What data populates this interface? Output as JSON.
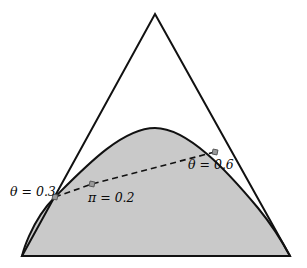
{
  "figure": {
    "title": "",
    "background_color": "#ffffff",
    "width": 307,
    "height": 268
  },
  "chart_data": {
    "type": "scatter",
    "title": "",
    "xlabel": "",
    "ylabel": "",
    "grid": false,
    "legend_position": "none",
    "shapes": [
      {
        "name": "simplex-triangle",
        "type": "polygon",
        "fill": "none",
        "stroke": "#111111",
        "stroke_width": 2,
        "points": [
          [
            155,
            14
          ],
          [
            290,
            256
          ],
          [
            22,
            256
          ]
        ]
      },
      {
        "name": "shaded-dome-region",
        "type": "closed-curve",
        "fill": "#c9c9c9",
        "stroke": "#111111",
        "stroke_width": 2,
        "peak": [
          155,
          128
        ],
        "left_tangent_point": [
          55,
          197
        ],
        "right_tangent_point": [
          278,
          239
        ],
        "base_left": [
          22,
          256
        ],
        "base_right": [
          290,
          256
        ]
      }
    ],
    "path": {
      "name": "dashed-trajectory",
      "type": "polyline",
      "stroke": "#111111",
      "stroke_width": 1.6,
      "dash_pattern": "6 4",
      "points": [
        [
          55,
          197
        ],
        [
          92,
          184
        ],
        [
          215,
          152
        ]
      ]
    },
    "markers": [
      {
        "name": "marker-theta-0-3",
        "x": 55,
        "y": 197,
        "shape": "square",
        "size": 5,
        "fill": "#9a9a9a",
        "stroke": "#555555"
      },
      {
        "name": "marker-pi-0-2",
        "x": 92,
        "y": 184,
        "shape": "square",
        "size": 5,
        "fill": "#9a9a9a",
        "stroke": "#555555"
      },
      {
        "name": "marker-theta-0-6",
        "x": 215,
        "y": 152,
        "shape": "square",
        "size": 5,
        "fill": "#9a9a9a",
        "stroke": "#555555"
      }
    ],
    "annotations": [
      {
        "name": "label-theta-left",
        "symbol": "θ",
        "relation": "=",
        "value": "0.3",
        "text": "θ = 0.3",
        "x": 10,
        "y": 192,
        "anchor": "start"
      },
      {
        "name": "label-pi-center",
        "symbol": "π",
        "relation": "=",
        "value": "0.2",
        "text": "π = 0.2",
        "x": 88,
        "y": 198,
        "anchor": "start"
      },
      {
        "name": "label-theta-right",
        "symbol": "θ",
        "relation": "=",
        "value": "0.6",
        "text": "θ = 0.6",
        "x": 188,
        "y": 165,
        "anchor": "start"
      }
    ],
    "colors": {
      "region_fill": "#c9c9c9",
      "outline": "#111111",
      "marker_fill": "#9a9a9a",
      "background": "#ffffff"
    }
  }
}
